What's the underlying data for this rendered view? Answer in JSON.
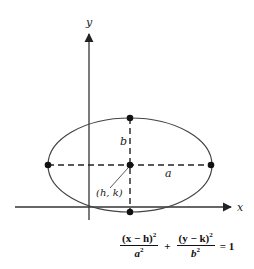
{
  "diagram": {
    "axes": {
      "x_label": "x",
      "y_label": "y"
    },
    "labels": {
      "center": "(h, k)",
      "semi_major": "a",
      "semi_minor": "b"
    },
    "points": [
      "center",
      "top vertex",
      "bottom vertex",
      "left vertex",
      "right vertex"
    ],
    "colors": {
      "stroke": "#333333",
      "background": "#ffffff"
    }
  },
  "equation": {
    "term1_num": "(x − h)",
    "term1_num_exp": "2",
    "term1_den": "a",
    "term1_den_exp": "2",
    "plus": "+",
    "term2_num": "(y − k)",
    "term2_num_exp": "2",
    "term2_den": "b",
    "term2_den_exp": "2",
    "rhs": "= 1"
  }
}
